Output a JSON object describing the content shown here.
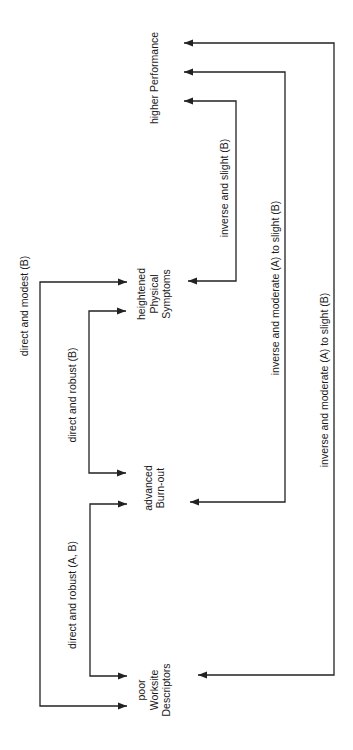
{
  "diagram": {
    "colors": {
      "ink": "#222222",
      "background": "#ffffff"
    },
    "nodes": [
      {
        "id": "performance",
        "lines": [
          "higher Performance"
        ],
        "cx": 155,
        "cy": 78
      },
      {
        "id": "symptoms",
        "lines": [
          "heightened",
          "Physical",
          "Symptoms"
        ],
        "cx": 155,
        "cy": 294
      },
      {
        "id": "burnout",
        "lines": [
          "advanced",
          "Burn-out"
        ],
        "cx": 155,
        "cy": 488
      },
      {
        "id": "worksite",
        "lines": [
          "poor",
          "Worksite",
          "Descriptors"
        ],
        "cx": 155,
        "cy": 690
      }
    ],
    "edges": [
      {
        "id": "worksite-symptoms",
        "label": "direct and modest (B)",
        "label_pos": {
          "x": 25,
          "y": 306
        },
        "path": [
          [
            127,
            282
          ],
          [
            40,
            282
          ],
          [
            40,
            706
          ],
          [
            127,
            706
          ]
        ],
        "arrows": [
          [
            127,
            282,
            "right"
          ],
          [
            127,
            706,
            "right"
          ]
        ]
      },
      {
        "id": "burnout-symptoms",
        "label": "direct and robust (B)",
        "label_pos": {
          "x": 73,
          "y": 395
        },
        "path": [
          [
            126,
            311
          ],
          [
            89,
            311
          ],
          [
            89,
            473
          ],
          [
            126,
            473
          ]
        ],
        "arrows": [
          [
            126,
            311,
            "right"
          ],
          [
            126,
            473,
            "right"
          ]
        ]
      },
      {
        "id": "worksite-burnout",
        "label": "direct and robust (A, B)",
        "label_pos": {
          "x": 73,
          "y": 595
        },
        "path": [
          [
            127,
            504
          ],
          [
            90,
            504
          ],
          [
            90,
            676
          ],
          [
            127,
            676
          ]
        ],
        "arrows": [
          [
            127,
            504,
            "right"
          ],
          [
            127,
            676,
            "right"
          ]
        ]
      },
      {
        "id": "symptoms-performance",
        "label": "inverse and slight (B)",
        "label_pos": {
          "x": 225,
          "y": 188
        },
        "path": [
          [
            184,
            101
          ],
          [
            236,
            101
          ],
          [
            236,
            281
          ],
          [
            188,
            281
          ]
        ],
        "arrows": [
          [
            184,
            101,
            "left"
          ],
          [
            188,
            281,
            "left"
          ]
        ]
      },
      {
        "id": "burnout-performance",
        "label": "inverse and moderate (A) to slight (B)",
        "label_pos": {
          "x": 276,
          "y": 288
        },
        "path": [
          [
            184,
            72
          ],
          [
            285,
            72
          ],
          [
            285,
            502
          ],
          [
            190,
            502
          ]
        ],
        "arrows": [
          [
            184,
            72,
            "left"
          ],
          [
            190,
            502,
            "left"
          ]
        ]
      },
      {
        "id": "worksite-performance",
        "label": "inverse and moderate (A) to slight (B)",
        "label_pos": {
          "x": 325,
          "y": 380
        },
        "path": [
          [
            184,
            43
          ],
          [
            334,
            43
          ],
          [
            334,
            675
          ],
          [
            198,
            675
          ]
        ],
        "arrows": [
          [
            184,
            43,
            "left"
          ],
          [
            198,
            675,
            "left"
          ]
        ]
      }
    ]
  }
}
